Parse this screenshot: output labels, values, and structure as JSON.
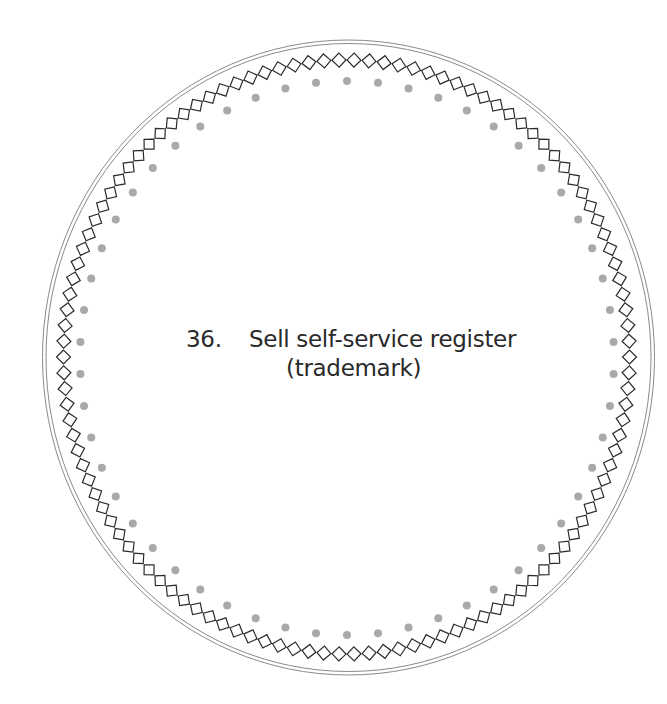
{
  "label": {
    "number": "36.",
    "title_line1": "Sell self-service register",
    "title_line2": "(trademark)"
  },
  "decoration": {
    "outer_ring": "double-line-ellipse",
    "middle_ring": "diamond-chain",
    "inner_ring": "dotted-ellipse",
    "diamond_count": 118,
    "dot_count": 54
  },
  "colors": {
    "ring_line": "#8a8a8a",
    "diamond_stroke": "#2b2b2b",
    "dot_fill": "#a9a9a9",
    "text": "#2a2a2a",
    "background": "#ffffff"
  }
}
